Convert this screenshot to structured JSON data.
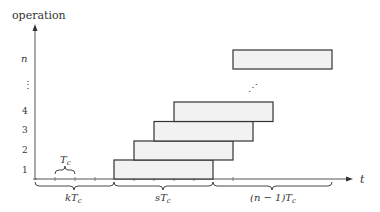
{
  "diagram": {
    "y_axis_label": "operation",
    "x_axis_label": "t",
    "row_labels": [
      {
        "text": "1",
        "y": 173
      },
      {
        "text": "2",
        "y": 153
      },
      {
        "text": "3",
        "y": 133
      },
      {
        "text": "4",
        "y": 114
      },
      {
        "text": "⋮",
        "y": 86
      },
      {
        "text": "n",
        "y": 62
      }
    ],
    "bars": [
      {
        "name": "operation-1",
        "x": 114,
        "y": 160,
        "w": 99,
        "h": 19
      },
      {
        "name": "operation-2",
        "x": 134,
        "y": 141,
        "w": 99,
        "h": 19
      },
      {
        "name": "operation-3",
        "x": 154,
        "y": 121,
        "w": 99,
        "h": 20
      },
      {
        "name": "operation-4",
        "x": 174,
        "y": 102,
        "w": 99,
        "h": 19
      },
      {
        "name": "operation-n",
        "x": 233,
        "y": 50,
        "w": 99,
        "h": 19
      }
    ],
    "ellipsis": "⋰",
    "ticks": [
      55,
      75,
      95,
      135,
      155,
      175,
      195,
      233
    ],
    "braces": {
      "tc": {
        "label": "T",
        "sub": "c",
        "x1": 55,
        "x2": 75
      },
      "ktc": {
        "label": "kT",
        "sub": "c",
        "x1": 35,
        "x2": 114
      },
      "stc": {
        "label": "sT",
        "sub": "c",
        "x1": 114,
        "x2": 213
      },
      "n1tc": {
        "label": "(n − 1)T",
        "sub": "c",
        "x1": 213,
        "x2": 332
      }
    },
    "colors": {
      "bar_fill": "#f2f2f2",
      "bar_stroke": "#333333",
      "axis": "#555555"
    }
  }
}
